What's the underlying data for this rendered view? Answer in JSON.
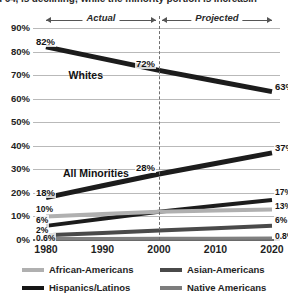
{
  "caption": {
    "text": "d 64, is declining; while the minority portion is increasin"
  },
  "chart_data": {
    "type": "line",
    "title": "",
    "xlabel": "",
    "ylabel": "",
    "x": [
      1980,
      1990,
      2000,
      2010,
      2020
    ],
    "xtick_labels": [
      "1980",
      "1990",
      "2000",
      "2010",
      "2020"
    ],
    "ylim": [
      0,
      90
    ],
    "ytick_labels": [
      "0%",
      "10%",
      "20%",
      "30%",
      "40%",
      "50%",
      "60%",
      "70%",
      "80%",
      "90%"
    ],
    "ytick_values": [
      0,
      10,
      20,
      30,
      40,
      50,
      60,
      70,
      80,
      90
    ],
    "grid": true,
    "legend_position": "bottom",
    "series": [
      {
        "name": "Whites",
        "color": "#1c1c1c",
        "width": 5,
        "values": [
          82,
          77,
          72,
          67.5,
          63
        ],
        "labels": [
          {
            "x": 1980,
            "y": 82,
            "text": "82%"
          },
          {
            "x": 2000,
            "y": 72,
            "text": "72%"
          },
          {
            "x": 2020,
            "y": 63,
            "text": "63%"
          }
        ]
      },
      {
        "name": "All Minorities",
        "color": "#1c1c1c",
        "width": 5,
        "values": [
          18,
          23,
          28,
          32.5,
          37
        ],
        "labels": [
          {
            "x": 1980,
            "y": 18,
            "text": "18%"
          },
          {
            "x": 2000,
            "y": 28,
            "text": "28%"
          },
          {
            "x": 2020,
            "y": 37,
            "text": "37%"
          }
        ]
      },
      {
        "name": "Hispanics/Latinos",
        "color": "#1c1c1c",
        "width": 4,
        "values": [
          6,
          9,
          12,
          14.5,
          17
        ],
        "labels": [
          {
            "x": 1980,
            "y": 6,
            "text": "6%"
          },
          {
            "x": 2020,
            "y": 17,
            "text": "17%"
          }
        ]
      },
      {
        "name": "African-Americans",
        "color": "#b0b0b0",
        "width": 4,
        "values": [
          10,
          11,
          12,
          12.5,
          13
        ],
        "labels": [
          {
            "x": 1980,
            "y": 10,
            "text": "10%"
          },
          {
            "x": 2020,
            "y": 13,
            "text": "13%"
          }
        ]
      },
      {
        "name": "Asian-Americans",
        "color": "#4a4a4a",
        "width": 4,
        "values": [
          2,
          3,
          4,
          5,
          6
        ],
        "labels": [
          {
            "x": 1980,
            "y": 2,
            "text": "2%"
          },
          {
            "x": 2020,
            "y": 6,
            "text": "6%"
          }
        ]
      },
      {
        "name": "Native Americans",
        "color": "#808080",
        "width": 3,
        "values": [
          0.6,
          0.65,
          0.7,
          0.75,
          0.8
        ],
        "labels": [
          {
            "x": 1980,
            "y": 0.6,
            "text": "0.6%"
          },
          {
            "x": 2020,
            "y": 0.8,
            "text": "0.8%"
          }
        ]
      }
    ],
    "annotations": [
      {
        "name": "whites-label",
        "text": "Whites"
      },
      {
        "name": "all-minorities-label",
        "text": "All Minorities"
      }
    ],
    "phases": [
      {
        "name": "actual",
        "label": "Actual",
        "from": 1980,
        "to": 2000
      },
      {
        "name": "projected",
        "label": "Projected",
        "from": 2000,
        "to": 2020
      }
    ],
    "divider_year": 2000
  },
  "legend": {
    "items": [
      {
        "label": "African-Americans",
        "color": "#b0b0b0"
      },
      {
        "label": "Asian-Americans",
        "color": "#4a4a4a"
      },
      {
        "label": "Hispanics/Latinos",
        "color": "#161616"
      },
      {
        "label": "Native Americans",
        "color": "#7d7d7d"
      }
    ]
  }
}
